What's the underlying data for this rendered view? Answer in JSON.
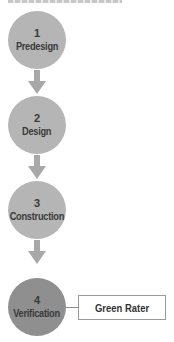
{
  "diagram": {
    "type": "process-flow",
    "colors": {
      "step_fill": "#b5b5b5",
      "final_step_fill": "#8f8f8f",
      "arrow": "#a8a8a8",
      "text": "#3a3a3a",
      "box_border": "#9a9a9a"
    },
    "steps": [
      {
        "number": "1",
        "label": "Predesign"
      },
      {
        "number": "2",
        "label": "Design"
      },
      {
        "number": "3",
        "label": "Construction"
      },
      {
        "number": "4",
        "label": "Verification"
      }
    ],
    "side_box": {
      "label": "Green Rater",
      "attached_to_step": "4"
    }
  }
}
